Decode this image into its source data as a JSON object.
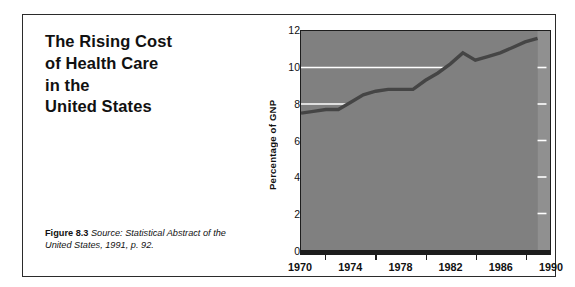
{
  "figure": {
    "title_lines": [
      "The Rising Cost",
      "of Health Care",
      "in the",
      "United States"
    ],
    "caption_label": "Figure 8.3",
    "caption_source": "Source: Statistical Abstract of the United States, 1991, p. 92."
  },
  "colors": {
    "area_fill": "#808080",
    "area_fill_light": "#909090",
    "curve_band": "#454545",
    "gridline": "#ffffff",
    "axis": "#1d1d1d",
    "frame": "#2b2b2b",
    "text": "#111111",
    "page_background": "#ffffff"
  },
  "chart_data": {
    "type": "area",
    "title": "The Rising Cost of Health Care in the United States",
    "xlabel": "",
    "ylabel": "Percentage of GNP",
    "xlim": [
      1970,
      1990
    ],
    "ylim": [
      0,
      12
    ],
    "grid": true,
    "gridlines_y": [
      8,
      10
    ],
    "legend": null,
    "x_tick_labels": [
      "1970",
      "1974",
      "1978",
      "1982",
      "1986",
      "1990"
    ],
    "x_ticks_major": [
      1970,
      1974,
      1978,
      1982,
      1986,
      1990
    ],
    "x_ticks_minor": [
      1972,
      1976,
      1980,
      1984,
      1988
    ],
    "y_tick_labels": [
      "0",
      "2",
      "4",
      "6",
      "8",
      "10",
      "12"
    ],
    "y_ticks": [
      0,
      2,
      4,
      6,
      8,
      10,
      12
    ],
    "series": [
      {
        "name": "Health care spending as percentage of GNP",
        "x": [
          1970,
          1971,
          1972,
          1973,
          1974,
          1975,
          1976,
          1977,
          1978,
          1979,
          1980,
          1981,
          1982,
          1983,
          1984,
          1985,
          1986,
          1987,
          1988,
          1989
        ],
        "values": [
          7.5,
          7.6,
          7.7,
          7.7,
          8.1,
          8.5,
          8.7,
          8.8,
          8.8,
          8.8,
          9.3,
          9.7,
          10.2,
          10.8,
          10.4,
          10.6,
          10.8,
          11.1,
          11.4,
          11.6
        ]
      }
    ],
    "annotations": [
      {
        "label": "data ends at 1989; shaded gap to 1990",
        "x": 1989.5
      }
    ]
  }
}
